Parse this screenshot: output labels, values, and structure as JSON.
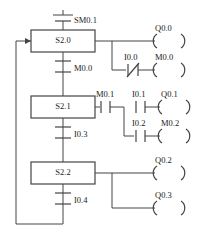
{
  "diagram": {
    "kind": "ladder-sfc",
    "title": "",
    "line_color": "#444444",
    "text_color": "#1a1a1a",
    "background": "#ffffff"
  },
  "steps": [
    {
      "id": "step-s2-0",
      "label": "S2.0"
    },
    {
      "id": "step-s2-1",
      "label": "S2.1"
    },
    {
      "id": "step-s2-2",
      "label": "S2.2"
    }
  ],
  "transitions": [
    {
      "id": "transition-sm0-1",
      "label": "SM0.1",
      "type": "no"
    },
    {
      "id": "transition-m0-0",
      "label": "M0.0",
      "type": "no"
    },
    {
      "id": "transition-i0-3",
      "label": "I0.3",
      "type": "no"
    },
    {
      "id": "transition-i0-4",
      "label": "I0.4",
      "type": "no"
    }
  ],
  "contacts": [
    {
      "id": "contact-i0-0",
      "label": "I0.0",
      "type": "nc"
    },
    {
      "id": "contact-m0-1",
      "label": "M0.1",
      "type": "no"
    },
    {
      "id": "contact-i0-1",
      "label": "I0.1",
      "type": "no"
    },
    {
      "id": "contact-i0-2",
      "label": "I0.2",
      "type": "no"
    }
  ],
  "coils": [
    {
      "id": "coil-q0-0",
      "label": "Q0.0"
    },
    {
      "id": "coil-m0-0",
      "label": "M0.0"
    },
    {
      "id": "coil-q0-1",
      "label": "Q0.1"
    },
    {
      "id": "coil-m0-2",
      "label": "M0.2"
    },
    {
      "id": "coil-q0-2",
      "label": "Q0.2"
    },
    {
      "id": "coil-q0-3",
      "label": "Q0.3"
    }
  ],
  "labels": {
    "sm0_1": "SM0.1",
    "s2_0": "S2.0",
    "q0_0": "Q0.0",
    "i0_0": "I0.0",
    "m0_0_coil": "M0.0",
    "m0_0_trans": "M0.0",
    "s2_1": "S2.1",
    "m0_1": "M0.1",
    "i0_1": "I0.1",
    "q0_1": "Q0.1",
    "i0_2": "I0.2",
    "m0_2": "M0.2",
    "i0_3": "I0.3",
    "s2_2": "S2.2",
    "q0_2": "Q0.2",
    "q0_3": "Q0.3",
    "i0_4": "I0.4"
  }
}
